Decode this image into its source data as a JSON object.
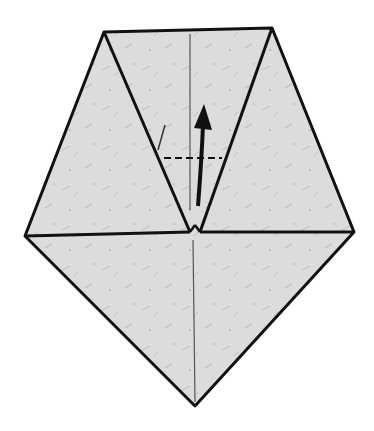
{
  "diagram": {
    "colors": {
      "paper": "#dcdcdc",
      "outline": "#111111",
      "crease": "#555555",
      "background": "#ffffff"
    },
    "shape": {
      "top_left": [
        104,
        32
      ],
      "top_right": [
        272,
        28
      ],
      "right": [
        354,
        232
      ],
      "bottom": [
        195,
        406
      ],
      "left": [
        25,
        236
      ],
      "center_left": [
        190,
        232
      ],
      "center_right": [
        200,
        232
      ]
    },
    "annotations": {
      "fold_line": "dashed valley fold",
      "arrow": "fold up"
    }
  }
}
